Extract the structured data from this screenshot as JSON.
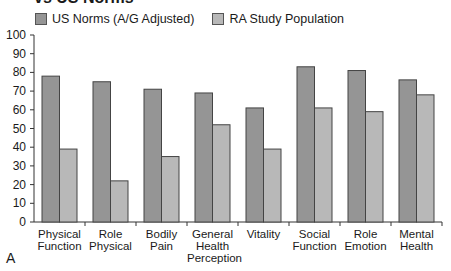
{
  "title": "vs US Norms",
  "panel_label": "A",
  "legend": [
    {
      "label": "US Norms (A/G Adjusted)",
      "color": "#959595"
    },
    {
      "label": "RA Study Population",
      "color": "#b8b8b8"
    }
  ],
  "y_ticks": [
    "100",
    "90",
    "80",
    "70",
    "60",
    "50",
    "40",
    "30",
    "20",
    "10",
    "0"
  ],
  "categories": [
    [
      "Physical",
      "Function"
    ],
    [
      "Role",
      "Physical"
    ],
    [
      "Bodily",
      "Pain"
    ],
    [
      "General",
      "Health",
      "Perception"
    ],
    [
      "Vitality"
    ],
    [
      "Social",
      "Function"
    ],
    [
      "Role",
      "Emotion"
    ],
    [
      "Mental",
      "Health"
    ]
  ],
  "chart_data": {
    "type": "bar",
    "title": "vs US Norms",
    "categories": [
      "Physical Function",
      "Role Physical",
      "Bodily Pain",
      "General Health Perception",
      "Vitality",
      "Social Function",
      "Role Emotion",
      "Mental Health"
    ],
    "series": [
      {
        "name": "US Norms (A/G Adjusted)",
        "values": [
          78,
          75,
          71,
          69,
          61,
          83,
          81,
          76
        ]
      },
      {
        "name": "RA Study Population",
        "values": [
          39,
          22,
          35,
          52,
          39,
          61,
          59,
          68
        ]
      }
    ],
    "xlabel": "",
    "ylabel": "",
    "ylim": [
      0,
      100
    ],
    "y_tick_step": 10,
    "grid": false,
    "legend_position": "top-left"
  }
}
